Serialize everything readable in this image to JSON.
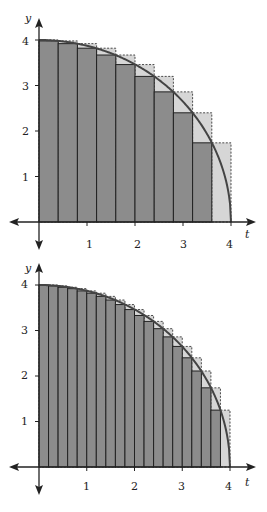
{
  "chart_data": [
    {
      "type": "bar",
      "title": "",
      "description": "Riemann sums for y = sqrt(16 - t^2) on [0,4] with n = 10",
      "xlabel": "t",
      "ylabel": "y",
      "xlim": [
        0,
        4
      ],
      "ylim": [
        0,
        4
      ],
      "xticks": [
        "1",
        "2",
        "3",
        "4"
      ],
      "yticks": [
        "1",
        "2",
        "3",
        "4"
      ],
      "n": 10,
      "dt": 0.4,
      "categories": [
        "0-0.4",
        "0.4-0.8",
        "0.8-1.2",
        "1.2-1.6",
        "1.6-2.0",
        "2.0-2.4",
        "2.4-2.8",
        "2.8-3.2",
        "3.2-3.6",
        "3.6-4.0"
      ],
      "series": [
        {
          "name": "lower (right endpoints, dark)",
          "values": [
            3.98,
            3.92,
            3.82,
            3.67,
            3.46,
            3.2,
            2.86,
            2.4,
            1.74,
            0
          ]
        },
        {
          "name": "upper (left endpoints, dashed light)",
          "values": [
            4,
            3.98,
            3.92,
            3.82,
            3.67,
            3.46,
            3.2,
            2.86,
            2.4,
            1.74
          ]
        }
      ],
      "curve": "y = sqrt(16 - t^2)",
      "grid": false
    },
    {
      "type": "bar",
      "title": "",
      "description": "Riemann sums for y = sqrt(16 - t^2) on [0,4] with n = 20",
      "xlabel": "t",
      "ylabel": "y",
      "xlim": [
        0,
        4
      ],
      "ylim": [
        0,
        4
      ],
      "xticks": [
        "1",
        "2",
        "3",
        "4"
      ],
      "yticks": [
        "1",
        "2",
        "3",
        "4"
      ],
      "n": 20,
      "dt": 0.2,
      "series": [
        {
          "name": "lower (right endpoints, dark)",
          "values": [
            4.0,
            3.98,
            3.95,
            3.92,
            3.87,
            3.82,
            3.75,
            3.67,
            3.57,
            3.46,
            3.33,
            3.2,
            3.04,
            2.86,
            2.65,
            2.4,
            2.11,
            1.74,
            1.25,
            0
          ]
        },
        {
          "name": "upper (left endpoints, dashed light)",
          "values": [
            4,
            4.0,
            3.98,
            3.95,
            3.92,
            3.87,
            3.82,
            3.75,
            3.67,
            3.57,
            3.46,
            3.33,
            3.2,
            3.04,
            2.86,
            2.65,
            2.4,
            2.11,
            1.74,
            1.25
          ]
        }
      ],
      "curve": "y = sqrt(16 - t^2)",
      "grid": false
    }
  ],
  "colors": {
    "dark_bar": "#8c8c8c",
    "light_bar": "#d6d6d6",
    "stroke": "#222222",
    "curve": "#444444"
  },
  "labels": {
    "top": {
      "y": "y",
      "t": "t",
      "x1": "1",
      "x2": "2",
      "x3": "3",
      "x4": "4",
      "y1": "1",
      "y2": "2",
      "y3": "3",
      "y4": "4"
    },
    "bottom": {
      "y": "y",
      "t": "t",
      "x1": "1",
      "x2": "2",
      "x3": "3",
      "x4": "4",
      "y1": "1",
      "y2": "2",
      "y3": "3",
      "y4": "4"
    }
  }
}
